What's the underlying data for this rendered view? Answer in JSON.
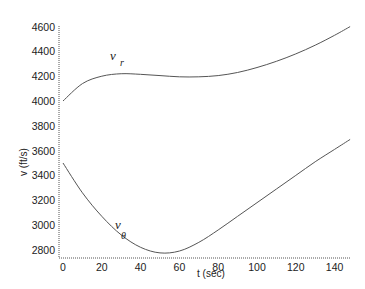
{
  "chart_data": {
    "type": "line",
    "title": "",
    "xlabel": "t (sec)",
    "ylabel": "v (ft/s)",
    "xlim": [
      -2,
      150
    ],
    "ylim": [
      2750,
      4600
    ],
    "xticks": [
      0,
      20,
      40,
      60,
      80,
      100,
      120,
      140
    ],
    "yticks": [
      2800,
      3000,
      3200,
      3400,
      3600,
      3800,
      4000,
      4200,
      4400,
      4600
    ],
    "grid": false,
    "x": [
      0,
      10,
      20,
      30,
      40,
      50,
      60,
      70,
      80,
      90,
      100,
      110,
      120,
      130,
      140,
      148
    ],
    "series": [
      {
        "name": "v_r",
        "label_main": "v",
        "label_sub": "r",
        "values": [
          4000,
          4140,
          4200,
          4220,
          4215,
          4205,
          4195,
          4195,
          4205,
          4230,
          4270,
          4320,
          4380,
          4450,
          4530,
          4600
        ]
      },
      {
        "name": "v_theta",
        "label_main": "v",
        "label_sub": "θ",
        "values": [
          3500,
          3260,
          3070,
          2920,
          2820,
          2775,
          2790,
          2860,
          2960,
          3070,
          3180,
          3290,
          3400,
          3510,
          3610,
          3690
        ]
      }
    ]
  }
}
